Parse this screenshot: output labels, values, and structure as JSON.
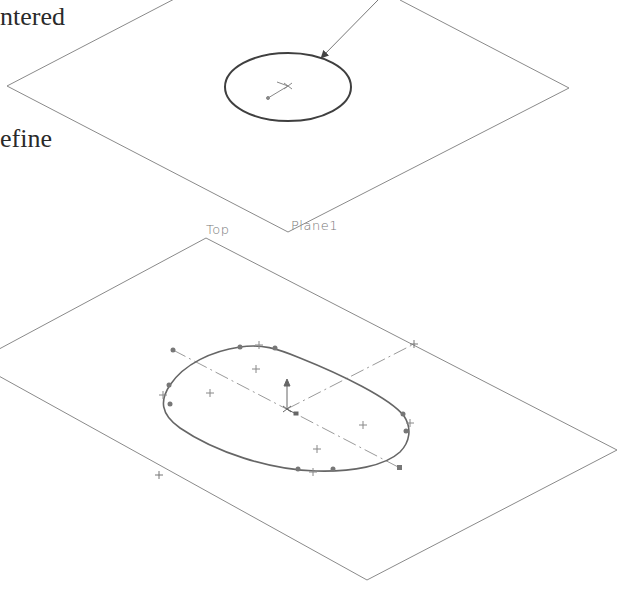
{
  "captions": {
    "line1": "ntered",
    "line2": "efine"
  },
  "planes": {
    "upper": {
      "label": "Plane1"
    },
    "lower": {
      "label": "Top"
    }
  },
  "colors": {
    "plane_edge": "#8a8a8a",
    "sketch_curve": "#555555",
    "centerline": "#9a9a9a",
    "text": "#2a2a2a",
    "label": "#777777"
  }
}
